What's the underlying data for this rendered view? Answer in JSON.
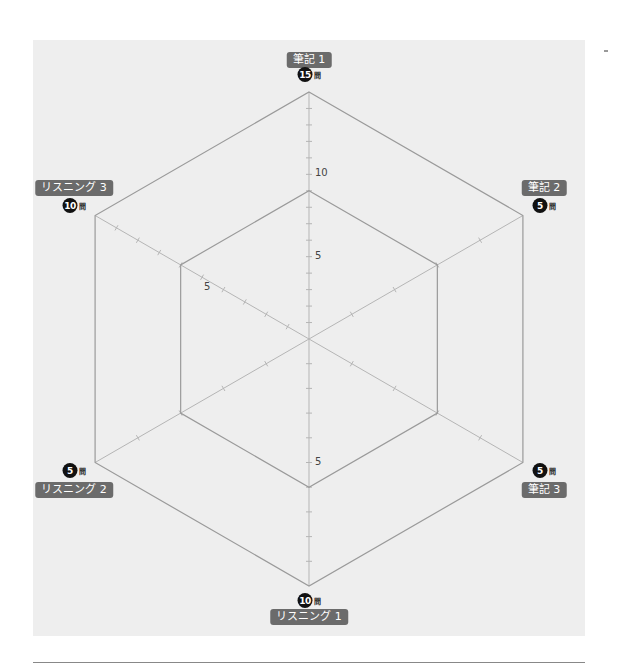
{
  "chart_data": {
    "type": "radar",
    "title": "",
    "center": [
      309,
      339
    ],
    "radius": 247,
    "axes": [
      {
        "name": "筆記 1",
        "max": 15,
        "count_label": "15",
        "unit": "問",
        "angle": -90,
        "tick_labels": [
          {
            "value": 5,
            "text": "5"
          },
          {
            "value": 10,
            "text": "10"
          }
        ]
      },
      {
        "name": "筆記 2",
        "max": 5,
        "count_label": "5",
        "unit": "問",
        "angle": -30,
        "tick_labels": []
      },
      {
        "name": "筆記 3",
        "max": 5,
        "count_label": "5",
        "unit": "問",
        "angle": 30,
        "tick_labels": []
      },
      {
        "name": "リスニング 1",
        "max": 10,
        "count_label": "10",
        "unit": "問",
        "angle": 90,
        "tick_labels": [
          {
            "value": 5,
            "text": "5"
          }
        ]
      },
      {
        "name": "リスニング 2",
        "max": 5,
        "count_label": "5",
        "unit": "問",
        "angle": 150,
        "tick_labels": []
      },
      {
        "name": "リスニング 3",
        "max": 10,
        "count_label": "10",
        "unit": "問",
        "angle": 210,
        "tick_labels": [
          {
            "value": 5,
            "text": "5"
          }
        ]
      }
    ],
    "series": [
      {
        "name": "outer",
        "values": [
          15,
          5,
          5,
          10,
          5,
          10
        ]
      },
      {
        "name": "inner",
        "values": [
          9,
          3,
          3,
          6,
          3,
          6
        ]
      }
    ],
    "grid": false,
    "legend": null
  },
  "colors": {
    "panel_bg": "#eeeeee",
    "line": "#9a9a9a",
    "axis": "#b5b5b5",
    "label_bg": "#6b6b6b",
    "badge_bg": "#111111"
  }
}
